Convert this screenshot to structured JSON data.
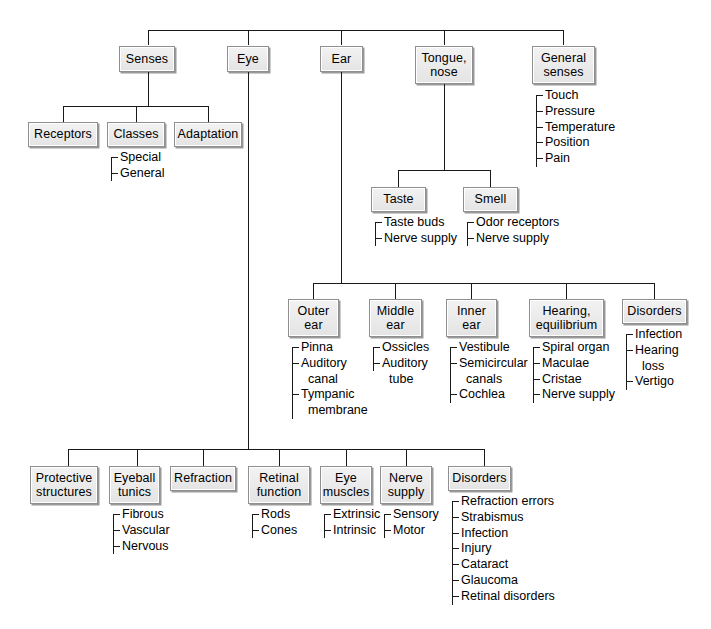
{
  "diagram": {
    "colors": {
      "box_fill": "#e9e9e9",
      "box_border": "#8f8f8f",
      "line": "#1a1a1a",
      "background": "#ffffff"
    },
    "top_row": {
      "senses": "Senses",
      "eye": "Eye",
      "ear": "Ear",
      "tongue_nose": "Tongue,\nnose",
      "general_senses": "General\nsenses"
    },
    "senses_children": {
      "receptors": "Receptors",
      "classes": "Classes",
      "adaptation": "Adaptation"
    },
    "classes_list": [
      "Special",
      "General"
    ],
    "general_senses_list": [
      "Touch",
      "Pressure",
      "Temperature",
      "Position",
      "Pain"
    ],
    "tongue_children": {
      "taste": "Taste",
      "smell": "Smell"
    },
    "taste_list": [
      "Taste buds",
      "Nerve supply"
    ],
    "smell_list": [
      "Odor receptors",
      "Nerve supply"
    ],
    "ear_children": {
      "outer_ear": "Outer\near",
      "middle_ear": "Middle\near",
      "inner_ear": "Inner\near",
      "hearing_equilibrium": "Hearing,\nequilibrium",
      "disorders": "Disorders"
    },
    "outer_ear_list": [
      "Pinna",
      "Auditory",
      "canal",
      "Tympanic",
      "membrane"
    ],
    "middle_ear_list": [
      "Ossicles",
      "Auditory",
      "tube"
    ],
    "inner_ear_list": [
      "Vestibule",
      "Semicircular",
      "canals",
      "Cochlea"
    ],
    "hearing_list": [
      "Spiral organ",
      "Maculae",
      "Cristae",
      "Nerve supply"
    ],
    "ear_disorders_list": [
      "Infection",
      "Hearing",
      "loss",
      "Vertigo"
    ],
    "eye_children": {
      "protective_structures": "Protective\nstructures",
      "eyeball_tunics": "Eyeball\ntunics",
      "refraction": "Refraction",
      "retinal_function": "Retinal\nfunction",
      "eye_muscles": "Eye\nmuscles",
      "nerve_supply": "Nerve\nsupply",
      "disorders": "Disorders"
    },
    "eyeball_tunics_list": [
      "Fibrous",
      "Vascular",
      "Nervous"
    ],
    "retinal_function_list": [
      "Rods",
      "Cones"
    ],
    "eye_muscles_list": [
      "Extrinsic",
      "Intrinsic"
    ],
    "eye_nerve_supply_list": [
      "Sensory",
      "Motor"
    ],
    "eye_disorders_list": [
      "Refraction errors",
      "Strabismus",
      "Infection",
      "Injury",
      "Cataract",
      "Glaucoma",
      "Retinal disorders"
    ]
  }
}
